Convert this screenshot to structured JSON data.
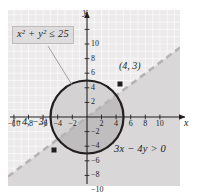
{
  "figure": {
    "kind": "coordinate-plane-graph",
    "background_color": "#ffffff",
    "plot_background_color": "#eceaea",
    "grid_color": "#ffffff",
    "axis_color": "#231f20",
    "curve_color": "#231f20",
    "dashed_line_color": "#b5b3b3",
    "shade_light_color": "#d9d7d7",
    "shade_dark_color": "#c3c1c1",
    "axis_name_x": "x",
    "axis_name_y": "y"
  },
  "annotations": {
    "circle_inequality": "x² + y² ≤ 25",
    "circle_inequality_base": "x",
    "line_inequality": "3x − 4y > 0",
    "point_a_label": "(4, 3)",
    "point_b_label": "(−4, −3)"
  },
  "chart_data": {
    "type": "scatter",
    "title": "",
    "xlabel": "x",
    "ylabel": "y",
    "xlim": [
      -11.5,
      11.5
    ],
    "ylim": [
      -11.5,
      11.5
    ],
    "grid": true,
    "grid_step": 1,
    "tick_step": 2,
    "x_ticks": [
      -10,
      -8,
      -6,
      -4,
      -2,
      2,
      4,
      6,
      8,
      10
    ],
    "y_ticks": [
      10,
      8,
      6,
      4,
      2,
      -2,
      -4,
      -6,
      -8,
      -10
    ],
    "x_tick_labels": [
      "−10",
      "−8",
      "−6",
      "−4",
      "−2",
      "2",
      "4",
      "6",
      "8",
      "10"
    ],
    "y_tick_labels": [
      "10",
      "8",
      "6",
      "4",
      "2",
      "−2",
      "−4",
      "−6",
      "−8",
      "−10"
    ],
    "series": [
      {
        "name": "x² + y² ≤ 25",
        "type": "circle-region",
        "center": [
          0,
          0
        ],
        "radius": 5,
        "boundary": "solid",
        "filled": true
      },
      {
        "name": "3x − 4y > 0",
        "type": "half-plane",
        "line": {
          "a": 3,
          "b": -4,
          "c": 0,
          "slope": 0.75,
          "intercept": 0
        },
        "boundary": "dashed",
        "shaded_side": "below-right"
      }
    ],
    "points": [
      {
        "label": "(4, 3)",
        "x": 4,
        "y": 3
      },
      {
        "label": "(−4, −3)",
        "x": -4,
        "y": -3
      }
    ],
    "legend": "none"
  }
}
